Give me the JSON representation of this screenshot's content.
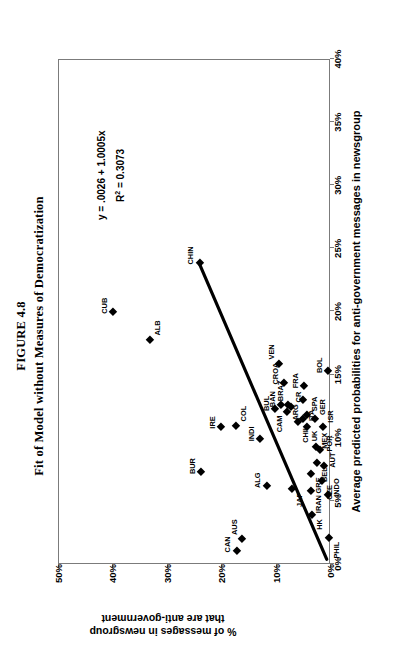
{
  "figure": {
    "title": "FIGURE 4.8",
    "subtitle": "Fit of Model without Measures of Democratization"
  },
  "annotations": {
    "equation": "y = .0026 + 1.0005x",
    "r_squared_prefix": "R",
    "r_squared_sup": "2",
    "r_squared_value": " = 0.3073"
  },
  "chart_data": {
    "type": "scatter",
    "title": "Fit of Model without Measures of Democratization",
    "xlabel": "Average predicted probabilities for anti-government messages in newsgroup",
    "ylabel_line1": "% of messages in newsgroup",
    "ylabel_line2": "that are anti-government",
    "xlim": [
      0,
      40
    ],
    "ylim": [
      0,
      50
    ],
    "xticks": [
      "0%",
      "5%",
      "10%",
      "15%",
      "20%",
      "25%",
      "30%",
      "35%",
      "40%"
    ],
    "xtick_values": [
      0,
      5,
      10,
      15,
      20,
      25,
      30,
      35,
      40
    ],
    "yticks": [
      "0%",
      "10%",
      "20%",
      "30%",
      "40%",
      "50%"
    ],
    "ytick_values": [
      0,
      10,
      20,
      30,
      40,
      50
    ],
    "grid": false,
    "legend": false,
    "units": "percent",
    "trendline": {
      "equation": "y = .0026 + 1.0005x",
      "r_squared": 0.3073,
      "intercept": 0.26,
      "slope": 1.0005,
      "x_start": 0.3,
      "y_start": 0.6,
      "x_end": 23.8,
      "y_end": 24.1
    },
    "points": [
      {
        "label": "CUB",
        "x": 19.9,
        "y": 40.0,
        "pos": "up"
      },
      {
        "label": "ALB",
        "x": 17.7,
        "y": 33.2,
        "pos": "dnr"
      },
      {
        "label": "CHIN",
        "x": 23.8,
        "y": 24.1,
        "pos": "up"
      },
      {
        "label": "BUR",
        "x": 7.2,
        "y": 23.8,
        "pos": "up"
      },
      {
        "label": "IRE",
        "x": 10.8,
        "y": 20.1,
        "pos": "up"
      },
      {
        "label": "COL",
        "x": 10.9,
        "y": 17.4,
        "pos": "dnr"
      },
      {
        "label": "CAN",
        "x": 1.0,
        "y": 17.3,
        "pos": "up"
      },
      {
        "label": "AUS",
        "x": 1.9,
        "y": 16.3,
        "pos": "upr"
      },
      {
        "label": "INDI",
        "x": 9.8,
        "y": 13.0,
        "pos": "up"
      },
      {
        "label": "ALG",
        "x": 6.1,
        "y": 11.8,
        "pos": "up"
      },
      {
        "label": "BUL",
        "x": 12.2,
        "y": 10.3,
        "pos": "up"
      },
      {
        "label": "VEN",
        "x": 15.8,
        "y": 9.5,
        "pos": "upr"
      },
      {
        "label": "CAM",
        "x": 12.0,
        "y": 8.1,
        "pos": "upl"
      },
      {
        "label": "BAN",
        "x": 12.5,
        "y": 9.1,
        "pos": "up"
      },
      {
        "label": "CROA",
        "x": 14.3,
        "y": 8.6,
        "pos": "up"
      },
      {
        "label": "BRAZ",
        "x": 12.5,
        "y": 7.8,
        "pos": "upr"
      },
      {
        "label": "CR",
        "x": 12.4,
        "y": 7.3,
        "pos": "dnr"
      },
      {
        "label": "JAP",
        "x": 5.9,
        "y": 7.2,
        "pos": "dnl"
      },
      {
        "label": "ARG",
        "x": 12.9,
        "y": 5.1,
        "pos": "upl"
      },
      {
        "label": "FRA",
        "x": 14.0,
        "y": 4.9,
        "pos": "up"
      },
      {
        "label": "CHIL",
        "x": 11.2,
        "y": 6.1,
        "pos": "dnl"
      },
      {
        "label": "ITA",
        "x": 11.4,
        "y": 5.2,
        "pos": "dn"
      },
      {
        "label": "SPA",
        "x": 11.7,
        "y": 4.4,
        "pos": "dnr"
      },
      {
        "label": "UK",
        "x": 10.8,
        "y": 4.4,
        "pos": "dnl"
      },
      {
        "label": "GER",
        "x": 11.4,
        "y": 2.9,
        "pos": "dnr"
      },
      {
        "label": "MEX",
        "x": 9.2,
        "y": 2.8,
        "pos": "dn"
      },
      {
        "label": "BEL",
        "x": 7.9,
        "y": 2.5,
        "pos": "dnl"
      },
      {
        "label": "GRE",
        "x": 7.1,
        "y": 3.7,
        "pos": "dnl"
      },
      {
        "label": "IRAN",
        "x": 5.7,
        "y": 3.6,
        "pos": "dnl"
      },
      {
        "label": "CZE",
        "x": 6.5,
        "y": 1.6,
        "pos": "dnl"
      },
      {
        "label": "AUT",
        "x": 7.7,
        "y": 1.3,
        "pos": "dn"
      },
      {
        "label": "POR",
        "x": 9.0,
        "y": 1.9,
        "pos": "dn"
      },
      {
        "label": "ISR",
        "x": 10.8,
        "y": 1.4,
        "pos": "dnr"
      },
      {
        "label": "BOL",
        "x": 15.2,
        "y": 0.5,
        "pos": "up"
      },
      {
        "label": "HK",
        "x": 3.8,
        "y": 3.5,
        "pos": "dnl"
      },
      {
        "label": "INDO",
        "x": 5.4,
        "y": 0.5,
        "pos": "dn"
      },
      {
        "label": "PHIL",
        "x": 2.0,
        "y": 0.4,
        "pos": "dnl"
      }
    ]
  }
}
